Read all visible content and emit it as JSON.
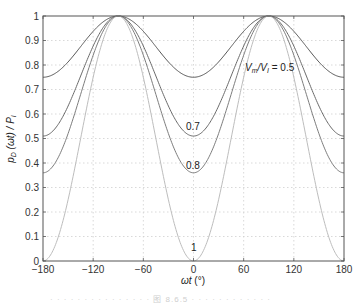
{
  "chart_data": {
    "type": "line",
    "title": "",
    "xlabel": "ωt (°)",
    "ylabel": "p_D (ωt) / P_I",
    "xlim": [
      -180,
      180
    ],
    "ylim": [
      0,
      1
    ],
    "xticks": [
      -180,
      -120,
      -60,
      0,
      60,
      120,
      180
    ],
    "yticks": [
      0,
      0.1,
      0.2,
      0.3,
      0.4,
      0.5,
      0.6,
      0.7,
      0.8,
      0.9,
      1
    ],
    "grid": true,
    "legend": "none (inline curve labels)",
    "x": [
      -180,
      -150,
      -120,
      -90,
      -60,
      -30,
      0,
      30,
      60,
      90,
      120,
      150,
      180
    ],
    "series": [
      {
        "name": "Vm/VI = 0.5",
        "m": 0.5,
        "color": "#555555",
        "values": [
          0.75,
          0.8125,
          0.9375,
          1.0,
          0.9375,
          0.8125,
          0.75,
          0.8125,
          0.9375,
          1.0,
          0.9375,
          0.8125,
          0.75
        ]
      },
      {
        "name": "0.7",
        "m": 0.7,
        "color": "#6a6a6a",
        "values": [
          0.51,
          0.6325,
          0.8775,
          1.0,
          0.8775,
          0.6325,
          0.51,
          0.6325,
          0.8775,
          1.0,
          0.8775,
          0.6325,
          0.51
        ]
      },
      {
        "name": "0.8",
        "m": 0.8,
        "color": "#7d7d7d",
        "values": [
          0.36,
          0.52,
          0.84,
          1.0,
          0.84,
          0.52,
          0.36,
          0.52,
          0.84,
          1.0,
          0.84,
          0.52,
          0.36
        ]
      },
      {
        "name": "1",
        "m": 1.0,
        "color": "#bdbdbd",
        "values": [
          0.0,
          0.25,
          0.75,
          1.0,
          0.75,
          0.25,
          0.0,
          0.25,
          0.75,
          1.0,
          0.75,
          0.25,
          0.0
        ]
      }
    ],
    "annotations": [
      {
        "text": "Vm/VI = 0.5",
        "x": 30,
        "y": 0.855
      },
      {
        "text": "0.7",
        "x": 0,
        "y": 0.6
      },
      {
        "text": "0.8",
        "x": 0,
        "y": 0.44
      },
      {
        "text": "1",
        "x": 0,
        "y": 0.08
      }
    ]
  },
  "labels": {
    "xlabel_omega": "ωt",
    "xlabel_unit": " (°)",
    "ylabel": "p",
    "ylabel_sub": "D",
    "ylabel_rest": " (ωt) / P",
    "ylabel_sub2": "I",
    "ann_v": "V",
    "ann_m": "m",
    "ann_slash": "/V",
    "ann_i": "I",
    "ann_val": " = 0.5",
    "ann_07": "0.7",
    "ann_08": "0.8",
    "ann_1": "1"
  },
  "caption": "· · · ·   · ·  · · · ·  · · · · · 图 8.6.5  ·  · · · ·  · · · · · · ·"
}
